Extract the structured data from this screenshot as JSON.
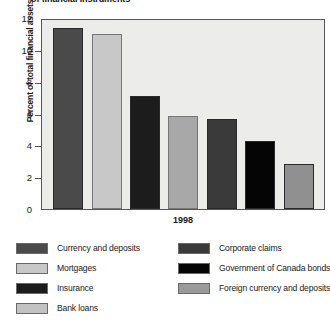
{
  "chart_data": {
    "type": "bar",
    "title": "of financial instruments",
    "xlabel": "1998",
    "ylabel": "Percent of total financial assets",
    "ylim": [
      0,
      12
    ],
    "yticks": [
      0,
      2,
      4,
      6,
      8,
      10,
      12
    ],
    "grid": false,
    "legend_position": "bottom",
    "categories": [
      "Currency and deposits",
      "Mortgages",
      "Insurance",
      "Bank loans",
      "Corporate claims",
      "Government of Canada bonds",
      "Foreign currency and deposits"
    ],
    "values": [
      11.4,
      11.0,
      7.1,
      5.85,
      5.65,
      4.3,
      2.8
    ],
    "colors": [
      "#4a4a4a",
      "#c8c8c8",
      "#1c1c1c",
      "#a8a8a8",
      "#3a3a3a",
      "#050505",
      "#909090"
    ]
  },
  "legend": {
    "left": [
      {
        "label": "Currency and deposits",
        "color": "#4a4a4a"
      },
      {
        "label": "Mortgages",
        "color": "#c8c8c8"
      },
      {
        "label": "Insurance",
        "color": "#1c1c1c"
      },
      {
        "label": "Bank loans",
        "color": "#c2c2c2"
      }
    ],
    "right": [
      {
        "label": "Corporate claims",
        "color": "#3a3a3a"
      },
      {
        "label": "Government of Canada bonds",
        "color": "#050505"
      },
      {
        "label": "Foreign currency and deposits",
        "color": "#9a9a9a"
      }
    ]
  }
}
